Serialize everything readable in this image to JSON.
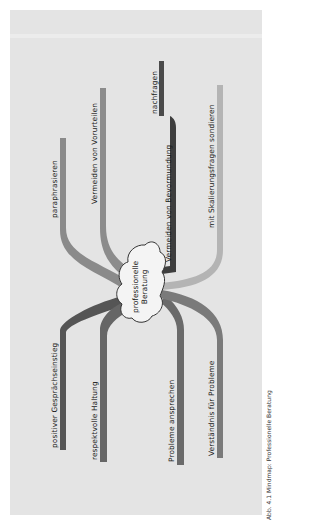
{
  "diagram": {
    "type": "mind-map",
    "orientation": "rotated-90-ccw",
    "center": {
      "line1": "professionelle",
      "line2": "Beratung"
    },
    "branches": [
      {
        "label": "paraphrasieren",
        "shade": "#8a8a8a"
      },
      {
        "label": "Vermeiden von Vorurteilen",
        "shade": "#8c8c8c"
      },
      {
        "label": "nachfragen",
        "shade": "#4a4a4a"
      },
      {
        "label": "Vermeiden von Bevormundung",
        "shade": "#3e3e3e"
      },
      {
        "label": "mit Skalierungsfragen sondieren",
        "shade": "#b4b4b4"
      },
      {
        "label": "positiver Gesprächseinstieg",
        "shade": "#555555"
      },
      {
        "label": "respektvolle Haltung",
        "shade": "#666666"
      },
      {
        "label": "Probleme ansprechen",
        "shade": "#6a6a6a"
      },
      {
        "label": "Verständnis für Probleme",
        "shade": "#7a7a7a"
      }
    ]
  },
  "caption": "Abb. 4.1 Mindmap: Professionelle Beratung",
  "colors": {
    "panel": "#e4e4e4",
    "page": "#ffffff",
    "cloud": "#f4f4f4"
  }
}
